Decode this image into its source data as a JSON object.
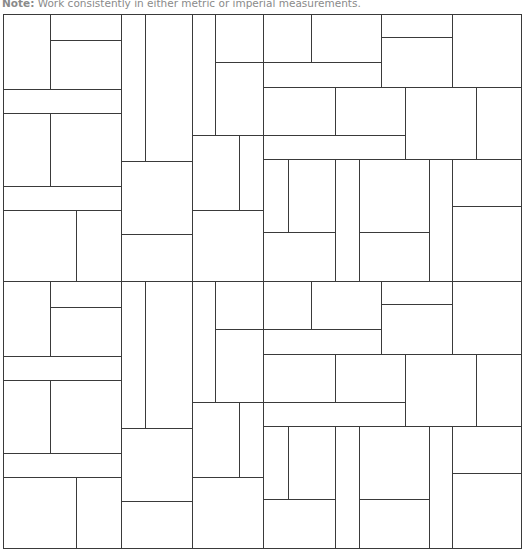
{
  "note": {
    "label": "Note:",
    "text": " Work consistently in either metric or imperial measurements."
  },
  "diagram": {
    "type": "tile-layout-pattern",
    "stroke_color": "#3a3a3a",
    "background": "#ffffff",
    "frame": {
      "x": 3,
      "y": 14,
      "width": 518,
      "height": 534
    },
    "tile_repeat_offsets_y": [
      0,
      267
    ],
    "tile_segments": [
      [
        50,
        14,
        50,
        89
      ],
      [
        50,
        40,
        121,
        40
      ],
      [
        3,
        89,
        121,
        89
      ],
      [
        121,
        14,
        121,
        281
      ],
      [
        145,
        14,
        145,
        161
      ],
      [
        3,
        113,
        121,
        113
      ],
      [
        50,
        113,
        50,
        186
      ],
      [
        3,
        186,
        121,
        186
      ],
      [
        3,
        210,
        121,
        210
      ],
      [
        76,
        210,
        76,
        281
      ],
      [
        121,
        161,
        192,
        161
      ],
      [
        121,
        234,
        192,
        234
      ],
      [
        192,
        14,
        192,
        281
      ],
      [
        215,
        14,
        215,
        135
      ],
      [
        215,
        62,
        263,
        62
      ],
      [
        192,
        135,
        263,
        135
      ],
      [
        239,
        135,
        239,
        210
      ],
      [
        192,
        210,
        263,
        210
      ],
      [
        263,
        14,
        263,
        281
      ],
      [
        311,
        14,
        311,
        62
      ],
      [
        263,
        62,
        381,
        62
      ],
      [
        381,
        14,
        381,
        87
      ],
      [
        381,
        37,
        452,
        37
      ],
      [
        452,
        14,
        452,
        87
      ],
      [
        263,
        87,
        521,
        87
      ],
      [
        335,
        87,
        335,
        135
      ],
      [
        263,
        135,
        405,
        135
      ],
      [
        405,
        87,
        405,
        159
      ],
      [
        476,
        87,
        476,
        159
      ],
      [
        263,
        159,
        521,
        159
      ],
      [
        288,
        159,
        288,
        232
      ],
      [
        263,
        232,
        335,
        232
      ],
      [
        335,
        159,
        335,
        281
      ],
      [
        359,
        159,
        359,
        281
      ],
      [
        359,
        232,
        429,
        232
      ],
      [
        429,
        159,
        429,
        281
      ],
      [
        452,
        159,
        452,
        281
      ],
      [
        452,
        206,
        521,
        206
      ],
      [
        3,
        281,
        521,
        281
      ]
    ]
  }
}
